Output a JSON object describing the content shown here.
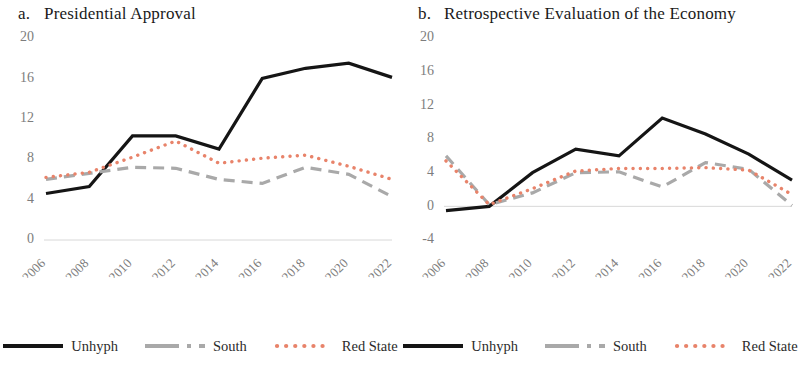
{
  "figure": {
    "panels": [
      {
        "id": "a",
        "label": "a.",
        "title": "Presidential Approval"
      },
      {
        "id": "b",
        "label": "b.",
        "title": "Retrospective Evaluation of the Economy"
      }
    ],
    "legend": {
      "items": [
        {
          "name": "Unhyph",
          "color": "#151515",
          "style": "solid"
        },
        {
          "name": "South",
          "color": "#a9a9a9",
          "style": "dashed"
        },
        {
          "name": "Red State",
          "color": "#e8836a",
          "style": "dotted"
        }
      ]
    }
  },
  "chart_data": [
    {
      "type": "line",
      "title": "Presidential Approval",
      "panel_label": "a.",
      "xlabel": "",
      "ylabel": "",
      "categories": [
        "2006",
        "2008",
        "2010",
        "2012",
        "2014",
        "2016",
        "2018",
        "2020",
        "2022"
      ],
      "ylim": [
        0,
        20
      ],
      "yticks": [
        0,
        4,
        8,
        12,
        16,
        20
      ],
      "grid": false,
      "legend_position": "bottom",
      "series": [
        {
          "name": "Unhyph",
          "color": "#151515",
          "style": "solid",
          "values": [
            4.6,
            5.3,
            10.3,
            10.3,
            9.0,
            16.0,
            17.0,
            17.5,
            16.1
          ]
        },
        {
          "name": "South",
          "color": "#a9a9a9",
          "style": "dashed",
          "values": [
            6.0,
            6.6,
            7.2,
            7.1,
            6.0,
            5.6,
            7.2,
            6.5,
            4.3
          ]
        },
        {
          "name": "Red State",
          "color": "#e8836a",
          "style": "dotted",
          "values": [
            6.2,
            6.7,
            8.2,
            9.8,
            7.6,
            8.1,
            8.4,
            7.3,
            6.0
          ]
        }
      ]
    },
    {
      "type": "line",
      "title": "Retrospective Evaluation of the Economy",
      "panel_label": "b.",
      "xlabel": "",
      "ylabel": "",
      "categories": [
        "2006",
        "2008",
        "2010",
        "2012",
        "2014",
        "2016",
        "2018",
        "2020",
        "2022"
      ],
      "ylim": [
        -4,
        20
      ],
      "yticks": [
        -4,
        0,
        4,
        8,
        12,
        16,
        20
      ],
      "grid": false,
      "legend_position": "bottom",
      "series": [
        {
          "name": "Unhyph",
          "color": "#151515",
          "style": "solid",
          "values": [
            -0.5,
            0.0,
            4.0,
            6.8,
            6.0,
            10.5,
            8.6,
            6.2,
            3.1
          ]
        },
        {
          "name": "South",
          "color": "#a9a9a9",
          "style": "dashed",
          "values": [
            6.0,
            0.2,
            1.6,
            4.0,
            4.1,
            2.3,
            5.2,
            4.4,
            0.1
          ]
        },
        {
          "name": "Red State",
          "color": "#e8836a",
          "style": "dotted",
          "values": [
            5.4,
            0.2,
            2.1,
            4.2,
            4.5,
            4.5,
            4.6,
            4.3,
            1.4
          ]
        }
      ]
    }
  ]
}
